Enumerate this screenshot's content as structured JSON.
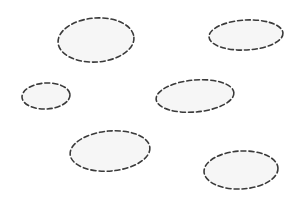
{
  "canvas": {
    "width": 299,
    "height": 202,
    "background": "#ffffff"
  },
  "style": {
    "stroke_color": "#3a3a3a",
    "fill_color": "#f6f6f6",
    "stroke_width": 1.6,
    "dash_pattern": "5 3"
  },
  "ellipses": [
    {
      "id": "ellipse-1",
      "cx": 96,
      "cy": 40,
      "rx": 38,
      "ry": 22,
      "rotate": -4
    },
    {
      "id": "ellipse-2",
      "cx": 246,
      "cy": 35,
      "rx": 37,
      "ry": 15,
      "rotate": -3
    },
    {
      "id": "ellipse-3",
      "cx": 46,
      "cy": 96,
      "rx": 24,
      "ry": 13,
      "rotate": -3
    },
    {
      "id": "ellipse-4",
      "cx": 195,
      "cy": 96,
      "rx": 39,
      "ry": 16,
      "rotate": -5
    },
    {
      "id": "ellipse-5",
      "cx": 110,
      "cy": 151,
      "rx": 40,
      "ry": 20,
      "rotate": -5
    },
    {
      "id": "ellipse-6",
      "cx": 241,
      "cy": 170,
      "rx": 37,
      "ry": 19,
      "rotate": -3
    }
  ]
}
